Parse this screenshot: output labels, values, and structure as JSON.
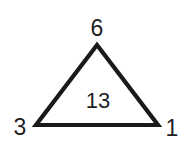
{
  "diagram": {
    "type": "triangle-number-puzzle",
    "vertices": {
      "top": "6",
      "bottom_left": "3",
      "bottom_right": "1"
    },
    "center": "13",
    "stroke_color": "#1a1a1a",
    "background": "#ffffff"
  }
}
